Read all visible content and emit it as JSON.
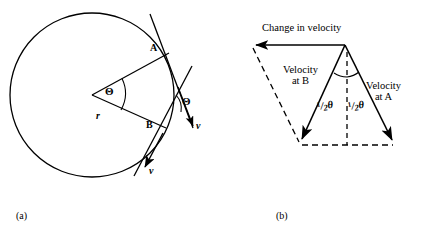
{
  "figure": {
    "background_color": "#ffffff",
    "stroke_color": "#000000",
    "panels": [
      {
        "caption": "(a)",
        "name": "circular-motion-geometry",
        "labels": {
          "point_a": "A",
          "point_b": "B",
          "radius": "r",
          "center_angle": "Θ",
          "tangent_angle": "Θ",
          "velocity_b": "v",
          "velocity_a": "v"
        }
      },
      {
        "caption": "(b)",
        "name": "velocity-vector-triangle",
        "labels": {
          "change_in_velocity": "Change in velocity",
          "velocity_at_b_line1": "Velocity",
          "velocity_at_b_line2": "at B",
          "velocity_at_a_line1": "Velocity",
          "velocity_at_a_line2": "at A",
          "half_theta_left_num": "1",
          "half_theta_left_den": "2",
          "half_theta_left_sym": "θ",
          "half_theta_right_num": "1",
          "half_theta_right_den": "2",
          "half_theta_right_sym": "θ"
        }
      }
    ]
  }
}
